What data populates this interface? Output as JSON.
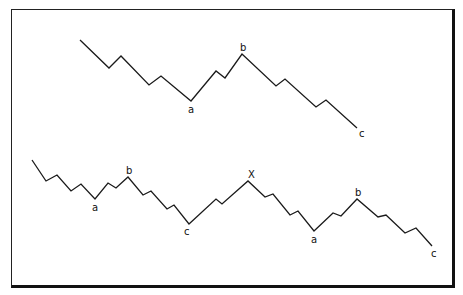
{
  "diagram": {
    "type": "Elliott wave corrective patterns",
    "patterns": [
      {
        "name": "zigzag-abc",
        "points": [
          [
            80,
            40
          ],
          [
            109,
            68
          ],
          [
            121,
            56
          ],
          [
            149,
            85
          ],
          [
            161,
            76
          ],
          [
            191,
            101
          ],
          [
            216,
            71
          ],
          [
            225,
            78
          ],
          [
            242,
            54
          ],
          [
            276,
            86
          ],
          [
            285,
            79
          ],
          [
            316,
            107
          ],
          [
            326,
            100
          ],
          [
            357,
            128
          ]
        ],
        "labels": [
          {
            "text": "a",
            "x": 188,
            "y": 113
          },
          {
            "text": "b",
            "x": 240,
            "y": 51
          },
          {
            "text": "c",
            "x": 359,
            "y": 137
          }
        ]
      },
      {
        "name": "double-zigzag-abc-x-abc",
        "points": [
          [
            32,
            160
          ],
          [
            46,
            181
          ],
          [
            57,
            175
          ],
          [
            71,
            191
          ],
          [
            81,
            184
          ],
          [
            95,
            199
          ],
          [
            108,
            183
          ],
          [
            116,
            188
          ],
          [
            128,
            177
          ],
          [
            143,
            195
          ],
          [
            151,
            191
          ],
          [
            167,
            209
          ],
          [
            174,
            205
          ],
          [
            189,
            224
          ],
          [
            216,
            199
          ],
          [
            222,
            204
          ],
          [
            248,
            181
          ],
          [
            265,
            197
          ],
          [
            273,
            194
          ],
          [
            290,
            215
          ],
          [
            298,
            211
          ],
          [
            314,
            231
          ],
          [
            333,
            213
          ],
          [
            341,
            216
          ],
          [
            357,
            199
          ],
          [
            378,
            217
          ],
          [
            386,
            215
          ],
          [
            405,
            233
          ],
          [
            416,
            228
          ],
          [
            432,
            246
          ]
        ],
        "labels": [
          {
            "text": "a",
            "x": 92,
            "y": 211
          },
          {
            "text": "b",
            "x": 126,
            "y": 174
          },
          {
            "text": "c",
            "x": 184,
            "y": 235
          },
          {
            "text": "X",
            "x": 248,
            "y": 178
          },
          {
            "text": "a",
            "x": 311,
            "y": 243
          },
          {
            "text": "b",
            "x": 355,
            "y": 196
          },
          {
            "text": "c",
            "x": 431,
            "y": 257
          }
        ]
      }
    ]
  }
}
